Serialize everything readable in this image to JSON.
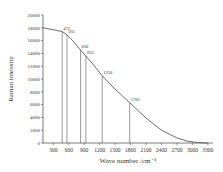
{
  "chart_data": {
    "type": "line",
    "title": "",
    "xlabel": "Wave number /cm⁻¹",
    "ylabel": "Raman intensity",
    "xlim": [
      100,
      3400
    ],
    "ylim": [
      0,
      20000
    ],
    "xticks": [
      300,
      600,
      900,
      1200,
      1500,
      1800,
      2100,
      2400,
      2700,
      3000,
      3300
    ],
    "yticks": [
      0,
      2000,
      4000,
      6000,
      8000,
      10000,
      12000,
      14000,
      16000,
      18000,
      20000
    ],
    "grid": false,
    "series": [
      {
        "name": "Raman spectrum",
        "x": [
          100,
          300,
          472,
          565,
          700,
          830,
          933,
          1100,
          1250,
          1500,
          1783,
          2100,
          2400,
          2700,
          2900,
          3100,
          3300
        ],
        "y": [
          18000,
          17700,
          17400,
          16900,
          15800,
          14500,
          13600,
          12000,
          10500,
          8400,
          6300,
          3900,
          2000,
          800,
          300,
          60,
          0
        ]
      }
    ],
    "peaks": [
      {
        "label": "472",
        "x": 472,
        "y": 17400
      },
      {
        "label": "565",
        "x": 565,
        "y": 16900
      },
      {
        "label": "830",
        "x": 830,
        "y": 14500
      },
      {
        "label": "933",
        "x": 933,
        "y": 13600
      },
      {
        "label": "1250",
        "x": 1250,
        "y": 10500
      },
      {
        "label": "1783",
        "x": 1783,
        "y": 6300
      }
    ]
  }
}
